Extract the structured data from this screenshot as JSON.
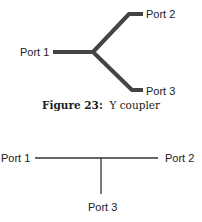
{
  "figures": [
    {
      "id": "y-coupler",
      "caption": {
        "label": "Figure 23:",
        "text": "Y coupler"
      },
      "ports": {
        "port1": "Port 1",
        "port2": "Port 2",
        "port3": "Port 3"
      },
      "line_color": "#444444"
    },
    {
      "id": "t-coupler",
      "ports": {
        "port1": "Port 1",
        "port2": "Port 2",
        "port3": "Port 3"
      },
      "line_color": "#333333"
    }
  ]
}
